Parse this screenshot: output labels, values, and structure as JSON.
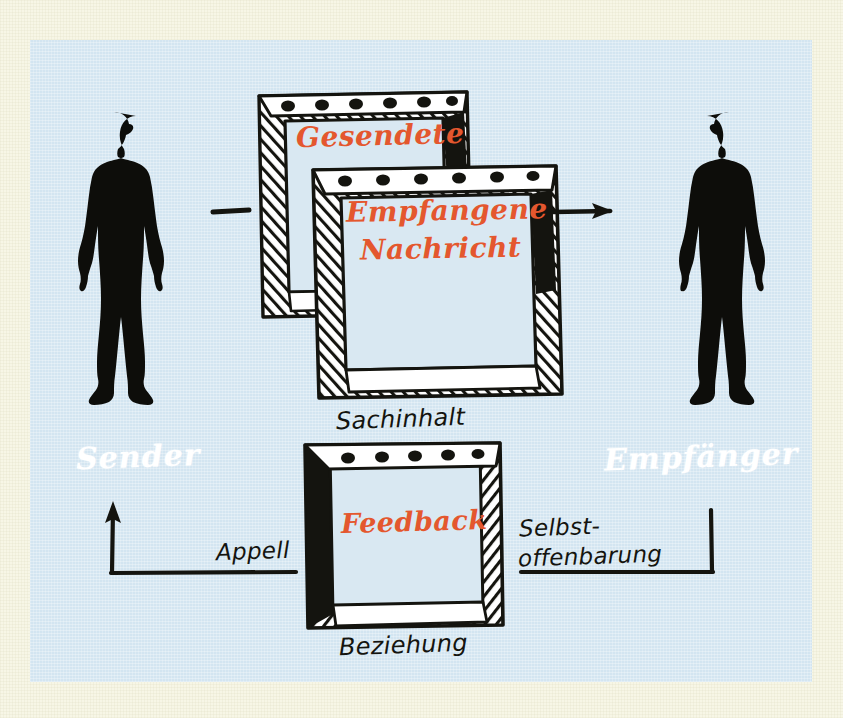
{
  "diagram": {
    "colors": {
      "paper": "#f7f6e6",
      "panel": "#d3e5f1",
      "ink": "#14140f",
      "accent_orange": "#e4572e",
      "label_white": "#ffffff"
    }
  },
  "figures": {
    "sender": {
      "role_label": "Sender",
      "icon": "person-silhouette-facing-right"
    },
    "receiver": {
      "role_label": "Empfänger",
      "icon": "person-silhouette-facing-left"
    }
  },
  "messages": {
    "sent": {
      "label": "Gesendete",
      "frame": "hatched-square-frame-back"
    },
    "received": {
      "label_line1": "Empfangene",
      "label_line2": "Nachricht",
      "frame": "hatched-square-frame-front"
    },
    "feedback": {
      "label": "Feedback",
      "frame": "hatched-square-frame-feedback"
    }
  },
  "sides": {
    "top": "Sachinhalt",
    "bottom": "Beziehung",
    "left": "Appell",
    "right_line1": "Selbst-",
    "right_line2": "offenbarung"
  },
  "connectors": {
    "sender_dash": "short-horizontal-dash",
    "receiver_arrow": "arrow-right",
    "feedback_left_arrow": "elbow-arrow-up-left",
    "feedback_right_elbow": "elbow-line-right"
  }
}
